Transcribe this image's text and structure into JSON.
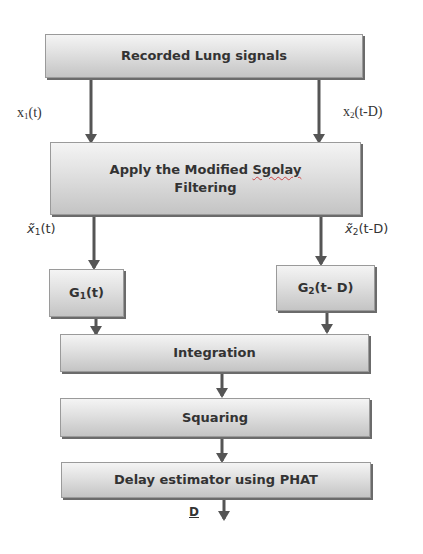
{
  "diagram": {
    "type": "flowchart",
    "nodes": [
      {
        "id": "recorded",
        "label": "Recorded Lung signals"
      },
      {
        "id": "filter",
        "label_line1": "Apply the Modified",
        "label_squiggle": "Sgolay",
        "label_line2": "Filtering"
      },
      {
        "id": "g1",
        "label_main": "G",
        "label_sub": "1",
        "label_tail": "(t)"
      },
      {
        "id": "g2",
        "label_main": "G",
        "label_sub": "2",
        "label_tail": "(t- D)"
      },
      {
        "id": "integration",
        "label": "Integration"
      },
      {
        "id": "squaring",
        "label": "Squaring"
      },
      {
        "id": "delay",
        "label": "Delay estimator using PHAT"
      }
    ],
    "edge_labels": {
      "x1": {
        "main": "x",
        "sub": "1",
        "tail": "(t)"
      },
      "x2": {
        "main": "x",
        "sub": "2",
        "tail": "(t-D)"
      },
      "x1_tilde": {
        "main": "x̃",
        "sub": "1",
        "tail": "(t)"
      },
      "x2_tilde": {
        "main": "x̃",
        "sub": "2",
        "tail": "(t-D)"
      },
      "output": "D"
    },
    "edges": [
      {
        "from": "recorded",
        "to": "filter",
        "label": "x1(t)"
      },
      {
        "from": "recorded",
        "to": "filter",
        "label": "x2(t-D)"
      },
      {
        "from": "filter",
        "to": "g1",
        "label": "x̃1(t)"
      },
      {
        "from": "filter",
        "to": "g2",
        "label": "x̃2(t-D)"
      },
      {
        "from": "g1",
        "to": "integration"
      },
      {
        "from": "g2",
        "to": "integration"
      },
      {
        "from": "integration",
        "to": "squaring"
      },
      {
        "from": "squaring",
        "to": "delay"
      },
      {
        "from": "delay",
        "to": "output",
        "label": "D"
      }
    ]
  },
  "colors": {
    "arrow": "#555555",
    "text": "#333333",
    "box_top": "#f4f4f4",
    "box_bottom": "#c4c4c4",
    "shadow": "#6b6b6b"
  }
}
